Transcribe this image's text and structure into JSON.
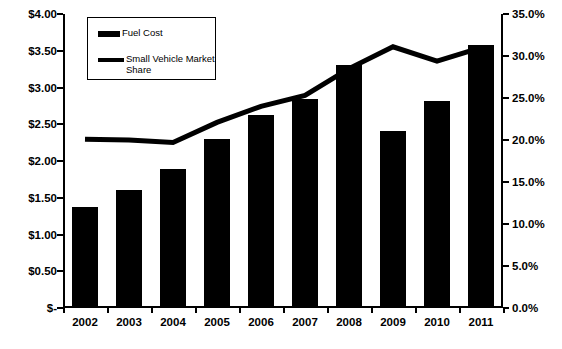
{
  "chart_data": {
    "type": "bar",
    "title": "",
    "subtitle": "",
    "xlabel": "",
    "ylabel": "",
    "grid": false,
    "legend_position": "top-left",
    "categories": [
      "2002",
      "2003",
      "2004",
      "2005",
      "2006",
      "2007",
      "2008",
      "2009",
      "2010",
      "2011"
    ],
    "series": [
      {
        "name": "Fuel Cost",
        "type": "bar",
        "axis": "left",
        "color": "#000000",
        "values": [
          1.38,
          1.6,
          1.89,
          2.3,
          2.62,
          2.85,
          3.3,
          2.41,
          2.81,
          3.58
        ]
      },
      {
        "name": "Small Vehicle Market Share",
        "type": "line",
        "axis": "right",
        "color": "#000000",
        "values": [
          20.1,
          20.0,
          19.7,
          22.1,
          24.0,
          25.3,
          28.5,
          31.1,
          29.4,
          31.0
        ]
      }
    ],
    "left_axis": {
      "label": "",
      "ylim": [
        0,
        4.0
      ],
      "tick_values": [
        0,
        0.5,
        1.0,
        1.5,
        2.0,
        2.5,
        3.0,
        3.5,
        4.0
      ],
      "tick_labels": [
        "$-",
        "$0.50",
        "$1.00",
        "$1.50",
        "$2.00",
        "$2.50",
        "$3.00",
        "$3.50",
        "$4.00"
      ]
    },
    "right_axis": {
      "label": "",
      "ylim": [
        0,
        35.0
      ],
      "tick_values": [
        0,
        5,
        10,
        15,
        20,
        25,
        30,
        35
      ],
      "tick_labels": [
        "0.0%",
        "5.0%",
        "10.0%",
        "15.0%",
        "20.0%",
        "25.0%",
        "30.0%",
        "35.0%"
      ]
    }
  },
  "legend": {
    "items": [
      {
        "label": "Fuel Cost",
        "marker": "bar-swatch"
      },
      {
        "label": "Small Vehicle Market Share",
        "marker": "line-swatch"
      }
    ]
  },
  "colors": {
    "series": "#000000",
    "axis": "#000000",
    "background": "#ffffff"
  }
}
